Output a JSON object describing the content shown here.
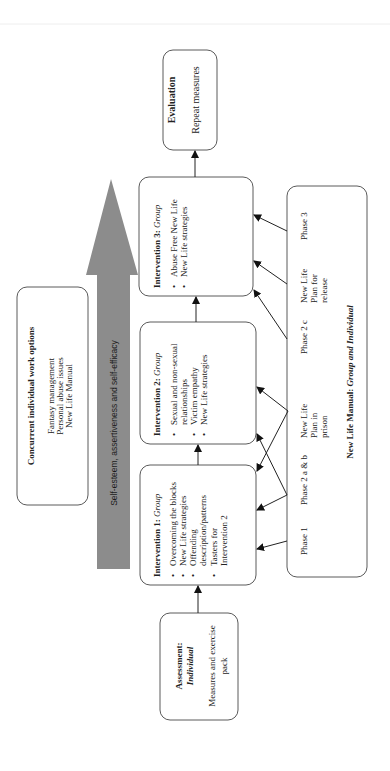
{
  "colors": {
    "box_border": "#5a5a5a",
    "arrow_fill": "#8c8c8c",
    "connector": "#222222",
    "text": "#222222",
    "background": "#ffffff"
  },
  "orientation": "rotated -90 degrees (text reads bottom-to-top)",
  "evaluation": {
    "title": "Evaluation",
    "body": "Repeat measures"
  },
  "assessment": {
    "title": "Assessment:",
    "subtitle": "Individual",
    "body_lines": [
      "Measures and exercise",
      "pack"
    ]
  },
  "concurrent": {
    "title": "Concurrent individual work options",
    "lines": [
      "Fantasy management",
      "Personal abuse issues",
      "New Life Manual"
    ]
  },
  "growth_arrow": {
    "label": "Self-esteem, assertiveness and self-efficacy"
  },
  "interventions": [
    {
      "title_prefix": "Intervention 1: ",
      "title_mode": "Group",
      "bullets": [
        [
          "Overcoming the blocks"
        ],
        [
          "New Life strategies"
        ],
        [
          "Offending",
          "description/patterns"
        ],
        [
          "Tasters for",
          "Intervention 2"
        ]
      ]
    },
    {
      "title_prefix": "Intervention 2: ",
      "title_mode": "Group",
      "bullets": [
        [
          "Sexual and non-sexual",
          "relationships"
        ],
        [
          "Victim empathy"
        ],
        [
          "New Life strategies"
        ]
      ]
    },
    {
      "title_prefix": "Intervention 3: ",
      "title_mode": "Group",
      "bullets": [
        [
          "Abuse Free New Life"
        ],
        [
          "New Life strategies"
        ]
      ]
    }
  ],
  "bullet_glyph": "•",
  "manual": {
    "footer_prefix": "New Life Manual: ",
    "footer_mode": "Group and Individual",
    "phases": [
      {
        "lines": [
          "Phase 1"
        ]
      },
      {
        "lines": [
          "Phase 2 a & b"
        ]
      },
      {
        "lines": [
          "New Life",
          "Plan in",
          "prison"
        ]
      },
      {
        "lines": [
          "Phase 2 c"
        ]
      },
      {
        "lines": [
          "New Life",
          "Plan for",
          "release"
        ]
      },
      {
        "lines": [
          "Phase 3"
        ]
      }
    ]
  },
  "connections": [
    {
      "from": "assessment",
      "to": "intervention-1"
    },
    {
      "from": "intervention-1",
      "to": "intervention-2"
    },
    {
      "from": "intervention-2",
      "to": "intervention-3"
    },
    {
      "from": "intervention-3",
      "to": "evaluation"
    },
    {
      "from": "phase-1",
      "to": "intervention-1"
    },
    {
      "from": "phase-2ab",
      "to": "intervention-1"
    },
    {
      "from": "phase-2ab",
      "to": "intervention-2"
    },
    {
      "from": "plan-in-prison",
      "to": "intervention-1"
    },
    {
      "from": "plan-in-prison",
      "to": "intervention-2"
    },
    {
      "from": "phase-2c",
      "to": "intervention-3"
    },
    {
      "from": "plan-for-release",
      "to": "intervention-3"
    },
    {
      "from": "phase-3",
      "to": "intervention-3"
    }
  ]
}
